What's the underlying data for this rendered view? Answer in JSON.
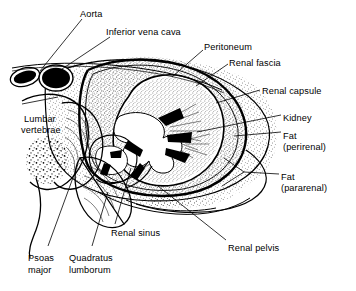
{
  "figure": {
    "type": "anatomical-line-diagram",
    "background_color": "#ffffff",
    "ink_color": "#000000",
    "width": 356,
    "height": 291
  },
  "labels": [
    {
      "id": "aorta",
      "text": "Aorta",
      "x": 80,
      "y": 9,
      "align": "left"
    },
    {
      "id": "inferior-vena-cava",
      "text": "Inferior vena cava",
      "x": 106,
      "y": 27,
      "align": "left"
    },
    {
      "id": "peritoneum",
      "text": "Peritoneum",
      "x": 204,
      "y": 42,
      "align": "left"
    },
    {
      "id": "renal-fascia",
      "text": "Renal fascia",
      "x": 229,
      "y": 58,
      "align": "left"
    },
    {
      "id": "renal-capsule",
      "text": "Renal capsule",
      "x": 262,
      "y": 86,
      "align": "left"
    },
    {
      "id": "kidney",
      "text": "Kidney",
      "x": 283,
      "y": 113,
      "align": "left"
    },
    {
      "id": "fat-perirenal",
      "text": "Fat",
      "x": 283,
      "y": 131,
      "align": "left"
    },
    {
      "id": "fat-perirenal-2",
      "text": "(perirenal)",
      "x": 283,
      "y": 142,
      "align": "left"
    },
    {
      "id": "fat-pararenal",
      "text": "Fat",
      "x": 281,
      "y": 172,
      "align": "left"
    },
    {
      "id": "fat-pararenal-2",
      "text": "(pararenal)",
      "x": 281,
      "y": 183,
      "align": "left"
    },
    {
      "id": "lumbar-vertebrae",
      "text": "Lumbar",
      "x": 24,
      "y": 114,
      "align": "left"
    },
    {
      "id": "lumbar-vertebrae-2",
      "text": "vertebrae",
      "x": 21,
      "y": 125,
      "align": "left"
    },
    {
      "id": "renal-sinus",
      "text": "Renal sinus",
      "x": 111,
      "y": 228,
      "align": "left"
    },
    {
      "id": "psoas-major",
      "text": "Psoas",
      "x": 28,
      "y": 253,
      "align": "left"
    },
    {
      "id": "psoas-major-2",
      "text": "major",
      "x": 28,
      "y": 265,
      "align": "left"
    },
    {
      "id": "quadratus-lumborum",
      "text": "Quadratus",
      "x": 69,
      "y": 253,
      "align": "left"
    },
    {
      "id": "quadratus-lumborum-2",
      "text": "lumborum",
      "x": 69,
      "y": 265,
      "align": "left"
    },
    {
      "id": "renal-pelvis",
      "text": "Renal pelvis",
      "x": 228,
      "y": 243,
      "align": "left"
    }
  ],
  "structures": [
    "aorta",
    "inferior vena cava",
    "peritoneum",
    "renal fascia",
    "renal capsule",
    "kidney",
    "perirenal fat",
    "pararenal fat",
    "lumbar vertebrae",
    "renal sinus",
    "psoas major",
    "quadratus lumborum",
    "renal pelvis"
  ]
}
